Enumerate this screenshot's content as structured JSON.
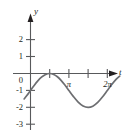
{
  "chart_data": {
    "type": "line",
    "title": "",
    "xlabel": "t",
    "ylabel": "y",
    "grid": false,
    "legend": null,
    "xlim": [
      -0.55,
      7.6
    ],
    "ylim": [
      -3.45,
      2.75
    ],
    "x_ticks": [
      {
        "value": 1.5708,
        "label": ""
      },
      {
        "value": 3.1416,
        "label": "π"
      },
      {
        "value": 4.7124,
        "label": ""
      },
      {
        "value": 6.2832,
        "label": "2π"
      }
    ],
    "y_ticks": [
      {
        "value": 2,
        "label": "2"
      },
      {
        "value": 1,
        "label": "1"
      },
      {
        "value": 0,
        "label": "0"
      },
      {
        "value": -1,
        "label": "-1"
      },
      {
        "value": -2,
        "label": "-2"
      },
      {
        "value": -3,
        "label": "-3"
      }
    ],
    "series": [
      {
        "name": "y = sin(t) - 1",
        "color": "#6d6e71",
        "x": [
          -0.52,
          -0.3,
          0.0,
          0.3,
          0.6,
          0.9,
          1.2,
          1.5708,
          1.9,
          2.2,
          2.5,
          2.8,
          3.1416,
          3.5,
          3.9,
          4.3,
          4.7124,
          5.1,
          5.5,
          5.9,
          6.2832,
          6.6,
          7.0,
          7.3
        ],
        "y": [
          -1.5,
          -1.3,
          -1.0,
          -0.705,
          -0.435,
          -0.217,
          -0.068,
          0.0,
          -0.054,
          -0.192,
          -0.402,
          -0.665,
          -1.0,
          -1.351,
          -1.688,
          -1.916,
          -2.0,
          -1.926,
          -1.705,
          -1.374,
          -1.0,
          -0.688,
          -0.343,
          -0.149
        ]
      }
    ]
  },
  "axis_labels": {
    "y": "y",
    "x": "t"
  }
}
